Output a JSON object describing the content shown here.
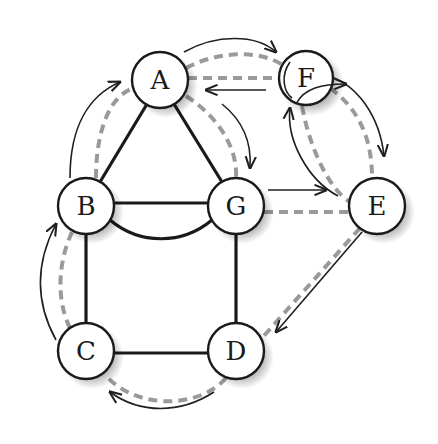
{
  "diagram": {
    "type": "graph-euler-tour",
    "nodes": [
      {
        "id": "A",
        "label": "A",
        "x": 160,
        "y": 80
      },
      {
        "id": "F",
        "label": "F",
        "x": 306,
        "y": 78
      },
      {
        "id": "B",
        "label": "B",
        "x": 86,
        "y": 206
      },
      {
        "id": "G",
        "label": "G",
        "x": 236,
        "y": 206
      },
      {
        "id": "E",
        "label": "E",
        "x": 377,
        "y": 206
      },
      {
        "id": "C",
        "label": "C",
        "x": 86,
        "y": 351
      },
      {
        "id": "D",
        "label": "D",
        "x": 236,
        "y": 351
      }
    ],
    "solid_edges": [
      {
        "from": "A",
        "to": "B"
      },
      {
        "from": "A",
        "to": "G"
      },
      {
        "from": "B",
        "to": "G",
        "style": "straight"
      },
      {
        "from": "B",
        "to": "G",
        "style": "curved-below"
      },
      {
        "from": "B",
        "to": "C"
      },
      {
        "from": "G",
        "to": "D"
      },
      {
        "from": "C",
        "to": "D"
      }
    ],
    "tour_path_order": [
      "B",
      "A",
      "F",
      "E",
      "F",
      "A",
      "G",
      "E",
      "D",
      "C",
      "B"
    ],
    "dashed_path_color": "#9a9a9a",
    "edge_color": "#1a1a1a"
  }
}
